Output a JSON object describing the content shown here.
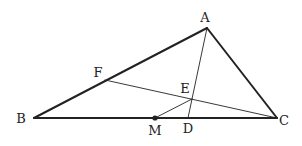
{
  "diagram": {
    "type": "geometry-triangle",
    "points": {
      "A": {
        "label": "A",
        "x": 207,
        "y": 28,
        "lx": 205,
        "ly": 22
      },
      "B": {
        "label": "B",
        "x": 34,
        "y": 118,
        "lx": 21,
        "ly": 123
      },
      "C": {
        "label": "C",
        "x": 277,
        "y": 118,
        "lx": 284,
        "ly": 125
      },
      "F": {
        "label": "F",
        "x": 105,
        "y": 80,
        "lx": 98,
        "ly": 77
      },
      "E": {
        "label": "E",
        "x": 192,
        "y": 99,
        "lx": 185,
        "ly": 93
      },
      "M": {
        "label": "M",
        "x": 155,
        "y": 118,
        "lx": 155,
        "ly": 135
      },
      "D": {
        "label": "D",
        "x": 188,
        "y": 118,
        "lx": 188,
        "ly": 133
      }
    },
    "segments": [
      {
        "from": "A",
        "to": "B",
        "style": "thick"
      },
      {
        "from": "B",
        "to": "C",
        "style": "thick"
      },
      {
        "from": "C",
        "to": "A",
        "style": "thick"
      },
      {
        "from": "A",
        "to": "D",
        "style": "thin"
      },
      {
        "from": "F",
        "to": "C",
        "style": "thin"
      },
      {
        "from": "M",
        "to": "E",
        "style": "thin"
      }
    ],
    "marked_points": [
      "M"
    ],
    "colors": {
      "stroke": "#222222",
      "background": "#ffffff"
    }
  }
}
